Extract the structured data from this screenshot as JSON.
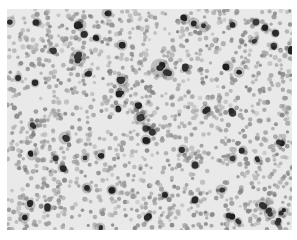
{
  "image": {
    "description": "Grayscale micrograph of a dense cell field: many medium-gray round cells with scattered darker, densely stained cells and clusters",
    "background_color": "#e9e9e9",
    "border_color": "#ffffff",
    "cell_color_light": "#a8a8a8",
    "cell_color_mid": "#8a8a8a",
    "cell_color_dark": "#1c1c1c",
    "frame": {
      "x": 7,
      "y": 9,
      "width": 285,
      "height": 221
    },
    "dark_clusters": [
      {
        "x": 10,
        "y": 22,
        "r": 4
      },
      {
        "x": 37,
        "y": 22,
        "r": 3
      },
      {
        "x": 107,
        "y": 13,
        "r": 4
      },
      {
        "x": 80,
        "y": 25,
        "r": 5
      },
      {
        "x": 84,
        "y": 34,
        "r": 3
      },
      {
        "x": 97,
        "y": 38,
        "r": 3
      },
      {
        "x": 52,
        "y": 50,
        "r": 3
      },
      {
        "x": 78,
        "y": 58,
        "r": 7
      },
      {
        "x": 122,
        "y": 45,
        "r": 4
      },
      {
        "x": 185,
        "y": 19,
        "r": 4
      },
      {
        "x": 194,
        "y": 23,
        "r": 4
      },
      {
        "x": 204,
        "y": 27,
        "r": 4
      },
      {
        "x": 233,
        "y": 24,
        "r": 3
      },
      {
        "x": 256,
        "y": 22,
        "r": 3
      },
      {
        "x": 265,
        "y": 28,
        "r": 3
      },
      {
        "x": 254,
        "y": 41,
        "r": 3
      },
      {
        "x": 275,
        "y": 33,
        "r": 3
      },
      {
        "x": 274,
        "y": 46,
        "r": 3
      },
      {
        "x": 290,
        "y": 50,
        "r": 3
      },
      {
        "x": 228,
        "y": 66,
        "r": 4
      },
      {
        "x": 239,
        "y": 72,
        "r": 4
      },
      {
        "x": 160,
        "y": 68,
        "r": 8
      },
      {
        "x": 168,
        "y": 74,
        "r": 5
      },
      {
        "x": 122,
        "y": 80,
        "r": 5
      },
      {
        "x": 120,
        "y": 93,
        "r": 4
      },
      {
        "x": 88,
        "y": 73,
        "r": 3
      },
      {
        "x": 18,
        "y": 78,
        "r": 3
      },
      {
        "x": 35,
        "y": 83,
        "r": 3
      },
      {
        "x": 118,
        "y": 108,
        "r": 3
      },
      {
        "x": 137,
        "y": 105,
        "r": 3
      },
      {
        "x": 186,
        "y": 68,
        "r": 3
      },
      {
        "x": 206,
        "y": 110,
        "r": 4
      },
      {
        "x": 232,
        "y": 112,
        "r": 3
      },
      {
        "x": 33,
        "y": 125,
        "r": 4
      },
      {
        "x": 65,
        "y": 138,
        "r": 5
      },
      {
        "x": 140,
        "y": 118,
        "r": 5
      },
      {
        "x": 147,
        "y": 128,
        "r": 4
      },
      {
        "x": 146,
        "y": 140,
        "r": 4
      },
      {
        "x": 32,
        "y": 155,
        "r": 4
      },
      {
        "x": 55,
        "y": 158,
        "r": 3
      },
      {
        "x": 100,
        "y": 155,
        "r": 4
      },
      {
        "x": 62,
        "y": 168,
        "r": 3
      },
      {
        "x": 85,
        "y": 158,
        "r": 3
      },
      {
        "x": 153,
        "y": 131,
        "r": 3
      },
      {
        "x": 183,
        "y": 150,
        "r": 4
      },
      {
        "x": 195,
        "y": 165,
        "r": 3
      },
      {
        "x": 232,
        "y": 158,
        "r": 4
      },
      {
        "x": 243,
        "y": 150,
        "r": 3
      },
      {
        "x": 258,
        "y": 160,
        "r": 3
      },
      {
        "x": 280,
        "y": 143,
        "r": 3
      },
      {
        "x": 87,
        "y": 188,
        "r": 4
      },
      {
        "x": 112,
        "y": 190,
        "r": 4
      },
      {
        "x": 30,
        "y": 205,
        "r": 4
      },
      {
        "x": 24,
        "y": 218,
        "r": 4
      },
      {
        "x": 48,
        "y": 208,
        "r": 3
      },
      {
        "x": 100,
        "y": 228,
        "r": 4
      },
      {
        "x": 148,
        "y": 217,
        "r": 3
      },
      {
        "x": 221,
        "y": 190,
        "r": 4
      },
      {
        "x": 262,
        "y": 205,
        "r": 5
      },
      {
        "x": 270,
        "y": 213,
        "r": 5
      },
      {
        "x": 283,
        "y": 212,
        "r": 4
      },
      {
        "x": 278,
        "y": 222,
        "r": 3
      },
      {
        "x": 230,
        "y": 217,
        "r": 4
      },
      {
        "x": 238,
        "y": 222,
        "r": 3
      },
      {
        "x": 195,
        "y": 200,
        "r": 3
      },
      {
        "x": 165,
        "y": 195,
        "r": 3
      }
    ],
    "light_regions": [
      {
        "x": 35,
        "y": 100,
        "r": 14
      },
      {
        "x": 100,
        "y": 120,
        "r": 12
      },
      {
        "x": 165,
        "y": 95,
        "r": 14
      },
      {
        "x": 210,
        "y": 175,
        "r": 16
      },
      {
        "x": 200,
        "y": 140,
        "r": 10
      },
      {
        "x": 15,
        "y": 180,
        "r": 10
      }
    ],
    "cell_count": 1500,
    "seed": 42
  }
}
